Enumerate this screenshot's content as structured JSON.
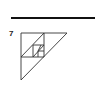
{
  "problem": {
    "number": "7"
  },
  "figure": {
    "stroke_color": "#333333",
    "rule_color": "#111111"
  }
}
